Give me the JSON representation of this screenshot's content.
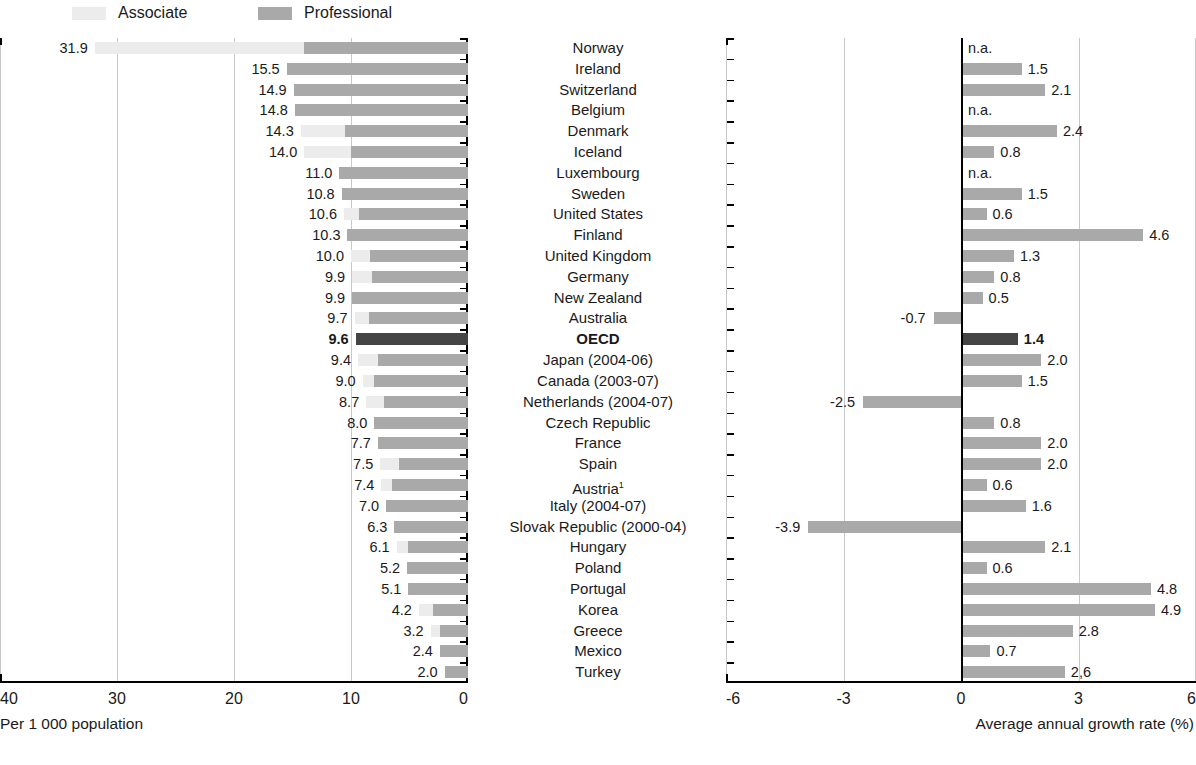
{
  "legend": {
    "items": [
      {
        "label": "Associate",
        "color": "#ececec",
        "swatch_x": 72,
        "label_x": 112
      },
      {
        "label": "Professional",
        "color": "#a9a9a9",
        "swatch_x": 258,
        "label_x": 298
      }
    ]
  },
  "left_axis": {
    "caption": "Per 1 000 population",
    "ticks": [
      "40",
      "30",
      "20",
      "10",
      "0"
    ]
  },
  "right_axis": {
    "caption": "Average annual growth rate (%)",
    "ticks": [
      "-6",
      "-3",
      "0",
      "3",
      "6"
    ]
  },
  "chart_data": {
    "type": "bar",
    "title": "",
    "subtitle": "",
    "panels": [
      {
        "name": "stock",
        "orientation": "horizontal",
        "xlabel": "Per 1 000 population",
        "xlim": [
          40,
          0
        ],
        "reversed": true,
        "xticks": [
          40,
          30,
          20,
          10,
          0
        ],
        "grid": true,
        "stacked": true,
        "series": [
          {
            "name": "Associate",
            "color": "#ececec"
          },
          {
            "name": "Professional",
            "color": "#a9a9a9"
          }
        ],
        "legend_position": "top-left"
      },
      {
        "name": "growth",
        "orientation": "horizontal",
        "xlabel": "Average annual growth rate (%)",
        "xlim": [
          -6,
          6
        ],
        "xticks": [
          -6,
          -3,
          0,
          3,
          6
        ],
        "grid": true,
        "zero_axis": true,
        "series": [
          {
            "name": "Average annual growth rate",
            "color": "#a9a9a9"
          }
        ],
        "legend_position": "none"
      }
    ],
    "categories": [
      "Norway",
      "Ireland",
      "Switzerland",
      "Belgium",
      "Denmark",
      "Iceland",
      "Luxembourg",
      "Sweden",
      "United States",
      "Finland",
      "United Kingdom",
      "Germany",
      "New Zealand",
      "Australia",
      "OECD",
      "Japan (2004-06)",
      "Canada (2003-07)",
      "Netherlands (2004-07)",
      "Czech Republic",
      "France",
      "Spain",
      "Austria",
      "Italy (2004-07)",
      "Slovak Republic (2000-04)",
      "Hungary",
      "Poland",
      "Portugal",
      "Korea",
      "Greece",
      "Mexico",
      "Turkey"
    ],
    "rows": [
      {
        "country": "Norway",
        "total": 31.9,
        "total_label": "31.9",
        "professional": 14.0,
        "associate": 17.9,
        "growth": null,
        "growth_label": "n.a.",
        "highlight": false,
        "note": false
      },
      {
        "country": "Ireland",
        "total": 15.5,
        "total_label": "15.5",
        "professional": 15.5,
        "associate": 0.0,
        "growth": 1.5,
        "growth_label": "1.5",
        "highlight": false,
        "note": false
      },
      {
        "country": "Switzerland",
        "total": 14.9,
        "total_label": "14.9",
        "professional": 14.9,
        "associate": 0.0,
        "growth": 2.1,
        "growth_label": "2.1",
        "highlight": false,
        "note": false
      },
      {
        "country": "Belgium",
        "total": 14.8,
        "total_label": "14.8",
        "professional": 14.8,
        "associate": 0.0,
        "growth": null,
        "growth_label": "n.a.",
        "highlight": false,
        "note": false
      },
      {
        "country": "Denmark",
        "total": 14.3,
        "total_label": "14.3",
        "professional": 10.5,
        "associate": 3.8,
        "growth": 2.4,
        "growth_label": "2.4",
        "highlight": false,
        "note": false
      },
      {
        "country": "Iceland",
        "total": 14.0,
        "total_label": "14.0",
        "professional": 10.0,
        "associate": 4.0,
        "growth": 0.8,
        "growth_label": "0.8",
        "highlight": false,
        "note": false
      },
      {
        "country": "Luxembourg",
        "total": 11.0,
        "total_label": "11.0",
        "professional": 11.0,
        "associate": 0.0,
        "growth": null,
        "growth_label": "n.a.",
        "highlight": false,
        "note": false
      },
      {
        "country": "Sweden",
        "total": 10.8,
        "total_label": "10.8",
        "professional": 10.8,
        "associate": 0.0,
        "growth": 1.5,
        "growth_label": "1.5",
        "highlight": false,
        "note": false
      },
      {
        "country": "United States",
        "total": 10.6,
        "total_label": "10.6",
        "professional": 9.3,
        "associate": 1.3,
        "growth": 0.6,
        "growth_label": "0.6",
        "highlight": false,
        "note": false
      },
      {
        "country": "Finland",
        "total": 10.3,
        "total_label": "10.3",
        "professional": 10.3,
        "associate": 0.0,
        "growth": 4.6,
        "growth_label": "4.6",
        "highlight": false,
        "note": false
      },
      {
        "country": "United Kingdom",
        "total": 10.0,
        "total_label": "10.0",
        "professional": 8.4,
        "associate": 1.6,
        "growth": 1.3,
        "growth_label": "1.3",
        "highlight": false,
        "note": false
      },
      {
        "country": "Germany",
        "total": 9.9,
        "total_label": "9.9",
        "professional": 8.2,
        "associate": 1.7,
        "growth": 0.8,
        "growth_label": "0.8",
        "highlight": false,
        "note": false
      },
      {
        "country": "New Zealand",
        "total": 9.9,
        "total_label": "9.9",
        "professional": 9.9,
        "associate": 0.0,
        "growth": 0.5,
        "growth_label": "0.5",
        "highlight": false,
        "note": false
      },
      {
        "country": "Australia",
        "total": 9.7,
        "total_label": "9.7",
        "professional": 8.5,
        "associate": 1.2,
        "growth": -0.7,
        "growth_label": "-0.7",
        "highlight": false,
        "note": false
      },
      {
        "country": "OECD",
        "total": 9.6,
        "total_label": "9.6",
        "professional": 9.6,
        "associate": 0.0,
        "growth": 1.4,
        "growth_label": "1.4",
        "highlight": true,
        "note": false
      },
      {
        "country": "Japan (2004-06)",
        "total": 9.4,
        "total_label": "9.4",
        "professional": 7.7,
        "associate": 1.7,
        "growth": 2.0,
        "growth_label": "2.0",
        "highlight": false,
        "note": false
      },
      {
        "country": "Canada (2003-07)",
        "total": 9.0,
        "total_label": "9.0",
        "professional": 8.0,
        "associate": 1.0,
        "growth": 1.5,
        "growth_label": "1.5",
        "highlight": false,
        "note": false
      },
      {
        "country": "Netherlands (2004-07)",
        "total": 8.7,
        "total_label": "8.7",
        "professional": 7.2,
        "associate": 1.5,
        "growth": -2.5,
        "growth_label": "-2.5",
        "highlight": false,
        "note": false
      },
      {
        "country": "Czech Republic",
        "total": 8.0,
        "total_label": "8.0",
        "professional": 8.0,
        "associate": 0.0,
        "growth": 0.8,
        "growth_label": "0.8",
        "highlight": false,
        "note": false
      },
      {
        "country": "France",
        "total": 7.7,
        "total_label": "7.7",
        "professional": 7.7,
        "associate": 0.0,
        "growth": 2.0,
        "growth_label": "2.0",
        "highlight": false,
        "note": false
      },
      {
        "country": "Spain",
        "total": 7.5,
        "total_label": "7.5",
        "professional": 5.9,
        "associate": 1.6,
        "growth": 2.0,
        "growth_label": "2.0",
        "highlight": false,
        "note": false
      },
      {
        "country": "Austria",
        "total": 7.4,
        "total_label": "7.4",
        "professional": 6.5,
        "associate": 0.9,
        "growth": 0.6,
        "growth_label": "0.6",
        "highlight": false,
        "note": true
      },
      {
        "country": "Italy (2004-07)",
        "total": 7.0,
        "total_label": "7.0",
        "professional": 7.0,
        "associate": 0.0,
        "growth": 1.6,
        "growth_label": "1.6",
        "highlight": false,
        "note": false
      },
      {
        "country": "Slovak Republic (2000-04)",
        "total": 6.3,
        "total_label": "6.3",
        "professional": 6.3,
        "associate": 0.0,
        "growth": -3.9,
        "growth_label": "-3.9",
        "highlight": false,
        "note": false
      },
      {
        "country": "Hungary",
        "total": 6.1,
        "total_label": "6.1",
        "professional": 5.1,
        "associate": 1.0,
        "growth": 2.1,
        "growth_label": "2.1",
        "highlight": false,
        "note": false
      },
      {
        "country": "Poland",
        "total": 5.2,
        "total_label": "5.2",
        "professional": 5.2,
        "associate": 0.0,
        "growth": 0.6,
        "growth_label": "0.6",
        "highlight": false,
        "note": false
      },
      {
        "country": "Portugal",
        "total": 5.1,
        "total_label": "5.1",
        "professional": 5.1,
        "associate": 0.0,
        "growth": 4.8,
        "growth_label": "4.8",
        "highlight": false,
        "note": false
      },
      {
        "country": "Korea",
        "total": 4.2,
        "total_label": "4.2",
        "professional": 3.0,
        "associate": 1.2,
        "growth": 4.9,
        "growth_label": "4.9",
        "highlight": false,
        "note": false
      },
      {
        "country": "Greece",
        "total": 3.2,
        "total_label": "3.2",
        "professional": 2.4,
        "associate": 0.8,
        "growth": 2.8,
        "growth_label": "2.8",
        "highlight": false,
        "note": false
      },
      {
        "country": "Mexico",
        "total": 2.4,
        "total_label": "2.4",
        "professional": 2.4,
        "associate": 0.0,
        "growth": 0.7,
        "growth_label": "0.7",
        "highlight": false,
        "note": false
      },
      {
        "country": "Turkey",
        "total": 2.0,
        "total_label": "2.0",
        "professional": 2.0,
        "associate": 0.0,
        "growth": 2.6,
        "growth_label": "2,6",
        "highlight": false,
        "note": false
      }
    ]
  }
}
